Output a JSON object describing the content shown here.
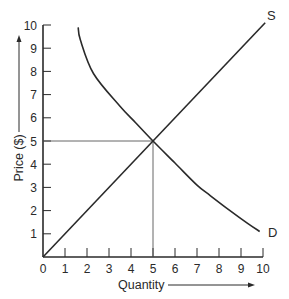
{
  "chart_data": {
    "type": "line",
    "title": "",
    "xlabel": "Quantity",
    "ylabel": "Price ($)",
    "xlim": [
      0,
      10
    ],
    "ylim": [
      0,
      10
    ],
    "x_ticks": [
      "0",
      "1",
      "2",
      "3",
      "4",
      "5",
      "6",
      "7",
      "8",
      "9",
      "10"
    ],
    "y_ticks": [
      "1",
      "2",
      "3",
      "4",
      "5",
      "6",
      "7",
      "8",
      "9",
      "10"
    ],
    "grid": false,
    "legend": "none (curves labeled directly)",
    "series": [
      {
        "name": "S",
        "label": "S",
        "description": "Supply",
        "points": [
          [
            0,
            0
          ],
          [
            5,
            5
          ],
          [
            10.1,
            10.1
          ]
        ]
      },
      {
        "name": "D",
        "label": "D",
        "description": "Demand",
        "points": [
          [
            1.6,
            9.9
          ],
          [
            1.7,
            9.35
          ],
          [
            2.3,
            7.9
          ],
          [
            3.5,
            6.5
          ],
          [
            4.2,
            5.8
          ],
          [
            5,
            5
          ],
          [
            6,
            4.05
          ],
          [
            7,
            3.1
          ],
          [
            7.6,
            2.65
          ],
          [
            8.5,
            2.0
          ],
          [
            9.3,
            1.45
          ],
          [
            9.85,
            1.1
          ]
        ]
      }
    ],
    "annotations": [
      {
        "type": "reference-lines",
        "description": "Equilibrium guide lines",
        "x": 5,
        "y": 5
      }
    ]
  },
  "labels": {
    "supply": "S",
    "demand": "D",
    "x_axis": "Quantity",
    "y_axis": "Price ($)"
  }
}
